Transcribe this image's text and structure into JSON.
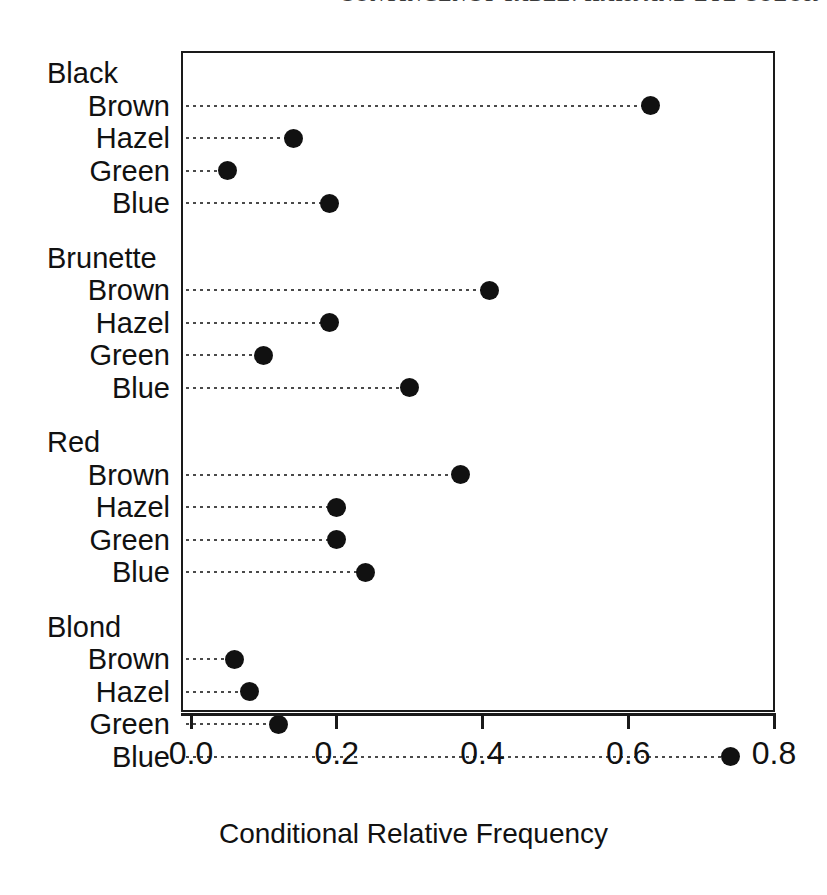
{
  "page_header": "CONTINGENCY TABLE: HAIR AND EYE COLOR",
  "chart_data": {
    "type": "bar",
    "subtype": "cleveland-dot-plot",
    "title": "",
    "xlabel": "Conditional Relative Frequency",
    "ylabel": "",
    "xlim": [
      0.0,
      0.8
    ],
    "xticks": [
      0.0,
      0.2,
      0.4,
      0.6,
      0.8
    ],
    "xticklabels": [
      "0.0",
      "0.2",
      "0.4",
      "0.6",
      "0.8"
    ],
    "grid": false,
    "legend": false,
    "dot_color": "#111111",
    "leader_line_style": "dotted",
    "groups": [
      {
        "label": "Black",
        "categories": [
          "Brown",
          "Hazel",
          "Green",
          "Blue"
        ],
        "values": [
          0.63,
          0.14,
          0.05,
          0.19
        ]
      },
      {
        "label": "Brunette",
        "categories": [
          "Brown",
          "Hazel",
          "Green",
          "Blue"
        ],
        "values": [
          0.41,
          0.19,
          0.1,
          0.3
        ]
      },
      {
        "label": "Red",
        "categories": [
          "Brown",
          "Hazel",
          "Green",
          "Blue"
        ],
        "values": [
          0.37,
          0.2,
          0.2,
          0.24
        ]
      },
      {
        "label": "Blond",
        "categories": [
          "Brown",
          "Hazel",
          "Green",
          "Blue"
        ],
        "values": [
          0.06,
          0.08,
          0.12,
          0.74
        ]
      }
    ]
  }
}
